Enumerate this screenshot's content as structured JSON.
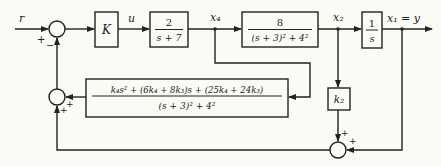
{
  "diagram": {
    "type": "block-diagram",
    "signals": {
      "input": "r",
      "control": "u",
      "state_x4": "x₄",
      "state_x2": "x₂",
      "output": "x₁ = y"
    },
    "blocks": {
      "gain": {
        "label": "K"
      },
      "actuator": {
        "numerator": "2",
        "denominator": "s + 7"
      },
      "plant": {
        "numerator": "8",
        "denominator": "(s + 3)² + 4²"
      },
      "integrator": {
        "numerator": "1",
        "denominator": "s"
      },
      "feedback_filter": {
        "numerator": "k₄s² + (6k₄ + 8k₃)s + (25k₄ + 24k₃)",
        "denominator": "(s + 3)² + 4²"
      },
      "k2_gain": {
        "label": "k₂"
      }
    },
    "summing_junctions": {
      "main": {
        "signs": {
          "r_input": "+",
          "feedback": "−"
        }
      },
      "feedback_combiner": {
        "signs": {
          "filter": "+",
          "bottom": "+"
        }
      },
      "output_combiner": {
        "signs": {
          "k2": "+",
          "y": "+"
        }
      }
    },
    "colors": {
      "line": "#222222",
      "background": "#fbfbf6"
    }
  }
}
